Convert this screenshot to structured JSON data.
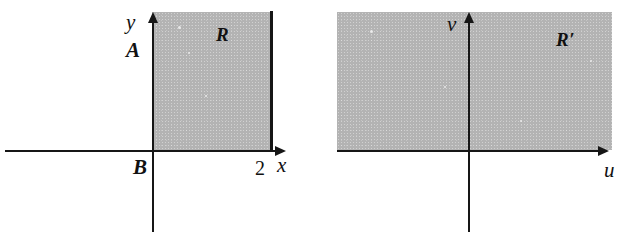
{
  "figure": {
    "background_color": "#ffffff",
    "shade_color": "#b3b3b3",
    "line_color": "#161616"
  },
  "left_panel": {
    "name": "xy-plane",
    "region_label": "R",
    "axis_labels": {
      "horizontal": "x",
      "vertical": "y"
    },
    "point_labels": {
      "top_left": "A",
      "origin": "B"
    },
    "tick_labels": {
      "x_right": "2"
    }
  },
  "right_panel": {
    "name": "uv-plane",
    "region_label": "R′",
    "axis_labels": {
      "horizontal": "u",
      "vertical": "v"
    }
  }
}
